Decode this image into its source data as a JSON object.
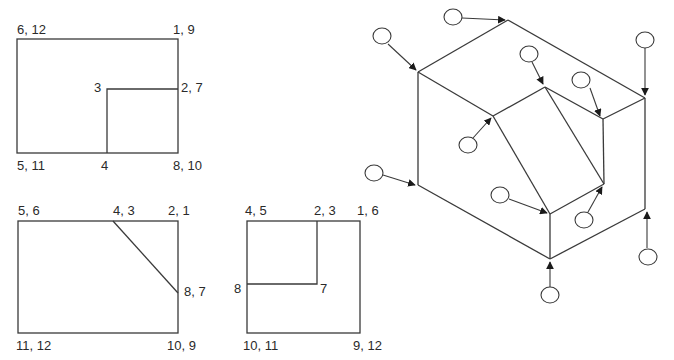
{
  "view_a": {
    "labels": {
      "top_left": "6, 12",
      "top_right": "1, 9",
      "inner_corner": "3",
      "right_mid": "2, 7",
      "bottom_left": "5, 11",
      "bottom_mid": "4",
      "bottom_right": "8, 10"
    }
  },
  "view_b": {
    "labels": {
      "top_left": "5, 6",
      "top_mid": "4, 3",
      "top_right": "2, 1",
      "right_mid": "8, 7",
      "bottom_left": "11, 12",
      "bottom_right": "10, 9"
    }
  },
  "view_c": {
    "labels": {
      "top_left": "4, 5",
      "top_mid": "2, 3",
      "top_right": "1, 6",
      "left_mid": "8",
      "inner_corner": "7",
      "bottom_left": "10, 11",
      "bottom_right": "9, 12"
    }
  },
  "isometric": {
    "vertex_markers": 12,
    "marker_shape": "circle",
    "marker_labels": [
      "",
      "",
      "",
      "",
      "",
      "",
      "",
      "",
      "",
      "",
      "",
      ""
    ]
  }
}
